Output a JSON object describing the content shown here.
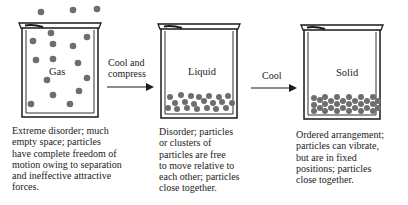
{
  "diagram": {
    "states": [
      {
        "name": "Gas",
        "description": "Extreme disorder; much\nempty space; particles\nhave complete freedom of\nmotion owing to separation\nand ineffective attractive\nforces."
      },
      {
        "name": "Liquid",
        "description": "Disorder; particles\nor clusters of\nparticles are free\nto move relative to\neach other; particles\nclose together."
      },
      {
        "name": "Solid",
        "description": "Ordered arrangement;\nparticles can vibrate,\nbut are in fixed\npositions; particles\nclose together."
      }
    ],
    "transitions": [
      {
        "label": "Cool and\ncompress",
        "from": "Gas",
        "to": "Liquid"
      },
      {
        "label": "Cool",
        "from": "Liquid",
        "to": "Solid"
      }
    ],
    "colors": {
      "particle": "#6e6e6e",
      "beaker_outline": "#1a1a1a",
      "text": "#222222"
    }
  }
}
